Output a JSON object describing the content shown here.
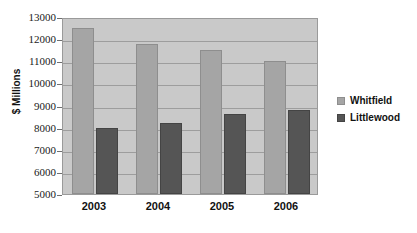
{
  "chart_data": {
    "type": "bar",
    "title": "",
    "subtitle": "",
    "xlabel": "",
    "ylabel": "$ Millions",
    "categories": [
      "2003",
      "2004",
      "2005",
      "2006"
    ],
    "series": [
      {
        "name": "Whitfield",
        "color": "#a5a5a5",
        "values": [
          12500,
          11800,
          11500,
          11000
        ]
      },
      {
        "name": "Littlewood",
        "color": "#555555",
        "values": [
          8000,
          8200,
          8600,
          8800
        ]
      }
    ],
    "ylim": [
      5000,
      13000
    ],
    "ytick_step": 1000,
    "yticks": [
      13000,
      12000,
      11000,
      10000,
      9000,
      8000,
      7000,
      6000,
      5000
    ],
    "ytick_labels": [
      "13000",
      "12000",
      "11000",
      "10000",
      "9000",
      "8000",
      "7000",
      "6000",
      "5000"
    ],
    "grid": true,
    "grid_axis": "y",
    "legend_position": "right",
    "plot_background": "#c9c9c9",
    "figure_background": "#ffffff",
    "gridline_color": "#9d9d9d",
    "axis_color": "#6f6f6f"
  }
}
